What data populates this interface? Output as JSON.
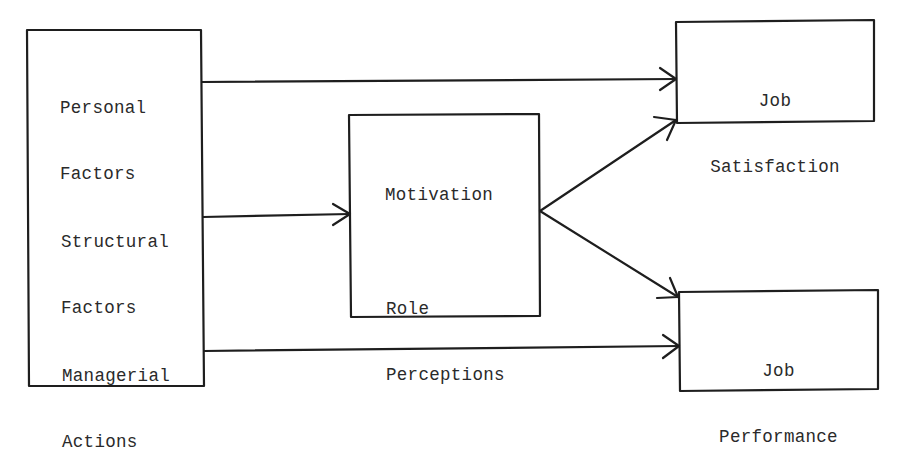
{
  "diagram": {
    "type": "flow-model",
    "stroke_color": "#1e1e1e",
    "background_color": "#ffffff",
    "caption_cut_off": true,
    "nodes": {
      "inputs": {
        "items": [
          {
            "id": "personal",
            "line1": "Personal",
            "line2": "Factors"
          },
          {
            "id": "structural",
            "line1": "Structural",
            "line2": "Factors"
          },
          {
            "id": "managerial",
            "line1": "Managerial",
            "line2": "Actions"
          }
        ]
      },
      "mediator": {
        "line1": "Motivation",
        "line2": "Role",
        "line3": "Perceptions"
      },
      "outcome_satisfaction": {
        "line1": "Job",
        "line2": "Satisfaction"
      },
      "outcome_performance": {
        "line1": "Job",
        "line2": "Performance"
      }
    },
    "edges": [
      {
        "from": "Personal Factors",
        "to": "Job Satisfaction"
      },
      {
        "from": "Structural Factors",
        "to": "Motivation / Role Perceptions"
      },
      {
        "from": "Managerial Actions",
        "to": "Job Performance"
      },
      {
        "from": "Motivation / Role Perceptions",
        "to": "Job Satisfaction"
      },
      {
        "from": "Motivation / Role Perceptions",
        "to": "Job Performance"
      }
    ]
  }
}
